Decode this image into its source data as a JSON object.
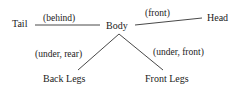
{
  "diagram": {
    "type": "relation-graph",
    "nodes": {
      "tail": "Tail",
      "body": "Body",
      "head": "Head",
      "back_legs": "Back Legs",
      "front_legs": "Front Legs"
    },
    "edges": [
      {
        "from": "Body",
        "to": "Tail",
        "label": "(behind)"
      },
      {
        "from": "Body",
        "to": "Head",
        "label": "(front)"
      },
      {
        "from": "Body",
        "to": "Back Legs",
        "label": "(under, rear)"
      },
      {
        "from": "Body",
        "to": "Front Legs",
        "label": "(under, front)"
      }
    ],
    "colors": {
      "line": "#333333",
      "text": "#222222",
      "background": "#ffffff"
    }
  }
}
